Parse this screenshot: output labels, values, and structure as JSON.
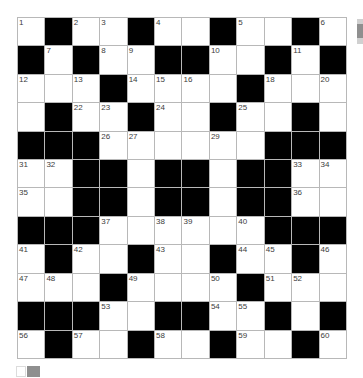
{
  "puzzle": {
    "type": "crossword-grid",
    "rows": 12,
    "cols": 12,
    "grid": [
      [
        "1",
        "#",
        "2",
        "3",
        "#",
        "4",
        "",
        "#",
        "5",
        "",
        "#",
        "6"
      ],
      [
        "#",
        "7",
        "#",
        "8",
        "9",
        "#",
        "#",
        "10",
        "",
        "#",
        "11",
        "#"
      ],
      [
        "12",
        "",
        "13",
        "#",
        "14",
        "15",
        "16",
        "",
        "#",
        "18",
        "",
        "20"
      ],
      [
        "",
        "#",
        "22",
        "23",
        "#",
        "24",
        "",
        "#",
        "25",
        "",
        "#",
        ""
      ],
      [
        "#",
        "#",
        "#",
        "26",
        "27",
        "",
        "",
        "29",
        "",
        "#",
        "#",
        "#"
      ],
      [
        "31",
        "32",
        "#",
        "#",
        "",
        "#",
        "#",
        "",
        "#",
        "#",
        "33",
        "34"
      ],
      [
        "35",
        "",
        "#",
        "#",
        "",
        "#",
        "#",
        "",
        "#",
        "#",
        "36",
        ""
      ],
      [
        "#",
        "#",
        "#",
        "37",
        "",
        "38",
        "39",
        "",
        "40",
        "#",
        "#",
        "#"
      ],
      [
        "41",
        "#",
        "42",
        "",
        "#",
        "43",
        "",
        "#",
        "44",
        "45",
        "#",
        "46"
      ],
      [
        "47",
        "48",
        "",
        "#",
        "49",
        "",
        "",
        "50",
        "#",
        "51",
        "52",
        ""
      ],
      [
        "#",
        "53",
        "#",
        "53",
        "",
        "#",
        "#",
        "54",
        "55",
        "#",
        "",
        "#"
      ],
      [
        "56",
        "#",
        "57",
        "",
        "#",
        "58",
        "",
        "#",
        "59",
        "",
        "#",
        "60"
      ]
    ],
    "visible_numbers": [
      1,
      2,
      3,
      4,
      5,
      6,
      7,
      8,
      9,
      10,
      11,
      12,
      13,
      14,
      15,
      16,
      18,
      20,
      22,
      23,
      24,
      25,
      26,
      27,
      29,
      31,
      32,
      33,
      34,
      35,
      36,
      37,
      38,
      39,
      40,
      41,
      42,
      43,
      44,
      45,
      46,
      47,
      48,
      49,
      50,
      51,
      52,
      53,
      54,
      55,
      56,
      57,
      58,
      59,
      60
    ]
  },
  "artifacts": {
    "scrollbar_fragment": {
      "position": "top-right",
      "clipped": true
    },
    "swatch_light": {
      "position": "bottom-left"
    },
    "swatch_grey": {
      "position": "bottom-left"
    }
  },
  "colors": {
    "black_cell": "#000000",
    "grid_line": "#b8b8b8",
    "number_text": "#3c3c3c",
    "scrollbar_track": "#d0d0d0",
    "scrollbar_thumb": "#8f8f8f",
    "swatch_grey": "#8f8f8f",
    "swatch_light_border": "#dcdcdc"
  }
}
